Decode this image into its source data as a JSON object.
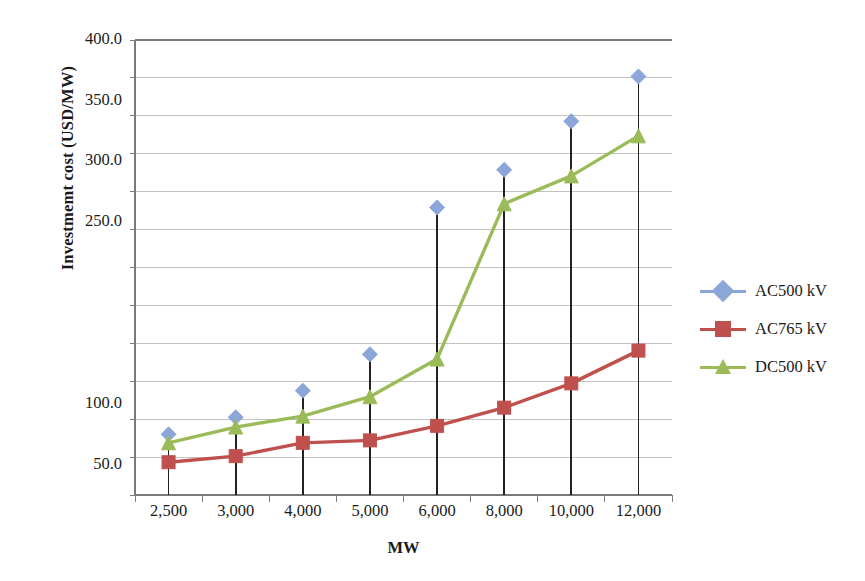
{
  "chart_data": {
    "type": "line",
    "title": "",
    "xlabel": "MW",
    "ylabel": "Investmemt cost (USD/MW)",
    "categories": [
      "2,500",
      "3,000",
      "4,000",
      "5,000",
      "6,000",
      "8,000",
      "10,000",
      "12,000"
    ],
    "x_values": [
      2500,
      3000,
      4000,
      5000,
      6000,
      8000,
      10000,
      12000
    ],
    "y_tick_labels": [
      "400.0",
      "350.0",
      "300.0",
      "250.0",
      "100.0",
      "50.0"
    ],
    "y_tick_values": [
      400.0,
      350.0,
      300.0,
      250.0,
      100.0,
      50.0
    ],
    "ylim": [
      25,
      400
    ],
    "grid": "horizontal",
    "legend_position": "right",
    "drop_lines": true,
    "series": [
      {
        "name": "AC500 kV",
        "color": "#8BA7D9",
        "marker": "diamond",
        "line_visible": false,
        "values": [
          75,
          89,
          111,
          141,
          262,
          293,
          333,
          370
        ]
      },
      {
        "name": "AC765 kV",
        "color": "#C0504D",
        "marker": "square",
        "line_visible": true,
        "values": [
          52,
          57,
          68,
          70,
          82,
          97,
          117,
          144
        ]
      },
      {
        "name": "DC500 kV",
        "color": "#9BBB59",
        "marker": "triangle",
        "line_visible": true,
        "values": [
          68,
          81,
          90,
          106,
          137,
          265,
          288,
          321
        ]
      }
    ]
  },
  "plot_area": {
    "left": 135,
    "top": 40,
    "right": 672,
    "bottom": 495
  },
  "legend": {
    "items": [
      {
        "label": "AC500 kV",
        "color": "#8BA7D9",
        "marker": "diamond"
      },
      {
        "label": "AC765 kV",
        "color": "#C0504D",
        "marker": "square"
      },
      {
        "label": "DC500 kV",
        "color": "#9BBB59",
        "marker": "triangle"
      }
    ]
  },
  "colors": {
    "axis": "#7a7a7a",
    "grid": "#9a9a9a",
    "dropline": "#222222",
    "text": "#1a1a1a"
  }
}
